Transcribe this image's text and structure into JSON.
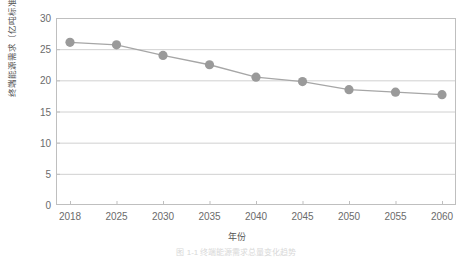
{
  "chart_data": {
    "type": "line",
    "title": "",
    "xlabel": "年份",
    "ylabel": "终端能源需求（亿吨标准煤）",
    "categories": [
      "2018",
      "2025",
      "2030",
      "2035",
      "2040",
      "2045",
      "2050",
      "2055",
      "2060"
    ],
    "values": [
      26.1,
      25.7,
      24.0,
      22.5,
      20.5,
      19.8,
      18.5,
      18.1,
      17.7
    ],
    "series": [
      {
        "name": "终端能源需求",
        "values": [
          26.1,
          25.7,
          24.0,
          22.5,
          20.5,
          19.8,
          18.5,
          18.1,
          17.7
        ]
      }
    ],
    "ylim": [
      0,
      30
    ],
    "yticks": [
      "0",
      "5",
      "10",
      "15",
      "20",
      "25",
      "30"
    ],
    "ytick_values": [
      0,
      5,
      10,
      15,
      20,
      25,
      30
    ],
    "grid": "horizontal",
    "legend": "none",
    "marker": "circle",
    "line_color": "#a6a6a6",
    "marker_color": "#9a9a9a",
    "grid_color": "#d0d0d0",
    "axis_color": "#bfbfbf"
  },
  "caption": {
    "text": "图 1-1  终端能源需求总量变化趋势"
  }
}
